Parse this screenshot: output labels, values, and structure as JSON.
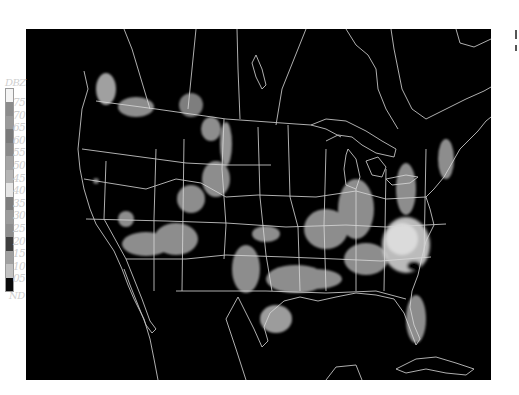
{
  "map": {
    "type": "composite radar reflectivity",
    "region": "continental United States",
    "background_color": "#000000",
    "boundary_color": "#d8d8d8",
    "notable_feature": "hurricane echo over North/South Carolina coast"
  },
  "legend": {
    "title": "DBZ",
    "levels": [
      {
        "label": "75",
        "color": "#f4f4f4"
      },
      {
        "label": "70",
        "color": "#8c8c8c"
      },
      {
        "label": "65",
        "color": "#9a9a9a"
      },
      {
        "label": "60",
        "color": "#7a7a7a"
      },
      {
        "label": "55",
        "color": "#8a8a8a"
      },
      {
        "label": "50",
        "color": "#a4a4a4"
      },
      {
        "label": "45",
        "color": "#b4b4b4"
      },
      {
        "label": "40",
        "color": "#e6e6e6"
      },
      {
        "label": "35",
        "color": "#7e7e7e"
      },
      {
        "label": "30",
        "color": "#9c9c9c"
      },
      {
        "label": "25",
        "color": "#8e8e8e"
      },
      {
        "label": "20",
        "color": "#3e3e3e"
      },
      {
        "label": "15",
        "color": "#a0a0a0"
      },
      {
        "label": "10",
        "color": "#c2c2c2"
      },
      {
        "label": "05",
        "color": "#0a0a0a"
      }
    ],
    "nd_label": "ND"
  }
}
